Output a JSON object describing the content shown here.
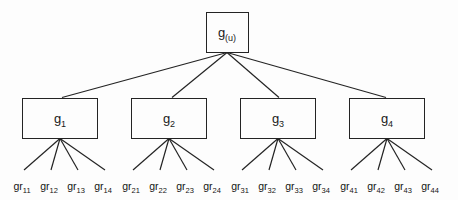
{
  "diagram": {
    "type": "tree",
    "background_color": "#fdfdfd",
    "line_color": "#242424",
    "root": {
      "base": "g",
      "sub": "(u)",
      "x": 227,
      "y": 32,
      "w": 43,
      "h": 41
    },
    "level2": [
      {
        "base": "g",
        "sub": "1",
        "cx": 60,
        "cy": 118,
        "w": 76,
        "h": 41,
        "anchor_x": 62
      },
      {
        "base": "g",
        "sub": "2",
        "cx": 169,
        "cy": 118,
        "w": 76,
        "h": 41,
        "anchor_x": 172
      },
      {
        "base": "g",
        "sub": "3",
        "cx": 278,
        "cy": 118,
        "w": 76,
        "h": 41,
        "anchor_x": 279
      },
      {
        "base": "g",
        "sub": "4",
        "cx": 387,
        "cy": 118,
        "w": 76,
        "h": 41,
        "anchor_x": 386
      }
    ],
    "leaves": [
      {
        "base": "gr",
        "sub": "11",
        "x": 22,
        "y": 181
      },
      {
        "base": "gr",
        "sub": "12",
        "x": 49,
        "y": 181
      },
      {
        "base": "gr",
        "sub": "13",
        "x": 76,
        "y": 181
      },
      {
        "base": "gr",
        "sub": "14",
        "x": 103,
        "y": 181
      },
      {
        "base": "gr",
        "sub": "21",
        "x": 131,
        "y": 181
      },
      {
        "base": "gr",
        "sub": "22",
        "x": 158,
        "y": 181
      },
      {
        "base": "gr",
        "sub": "23",
        "x": 185,
        "y": 181
      },
      {
        "base": "gr",
        "sub": "24",
        "x": 212,
        "y": 181
      },
      {
        "base": "gr",
        "sub": "31",
        "x": 240,
        "y": 181
      },
      {
        "base": "gr",
        "sub": "32",
        "x": 267,
        "y": 181
      },
      {
        "base": "gr",
        "sub": "33",
        "x": 294,
        "y": 181
      },
      {
        "base": "gr",
        "sub": "34",
        "x": 321,
        "y": 181
      },
      {
        "base": "gr",
        "sub": "41",
        "x": 349,
        "y": 181
      },
      {
        "base": "gr",
        "sub": "42",
        "x": 376,
        "y": 181
      },
      {
        "base": "gr",
        "sub": "43",
        "x": 403,
        "y": 181
      },
      {
        "base": "gr",
        "sub": "44",
        "x": 430,
        "y": 181
      }
    ]
  }
}
